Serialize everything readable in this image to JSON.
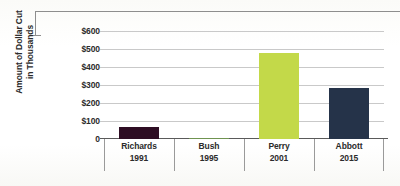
{
  "chart_data": {
    "type": "bar",
    "title": "",
    "xlabel": "",
    "ylabel": "Amount of Dollar Cut in Thousands",
    "ylabel_line1": "Amount of Dollar Cut",
    "ylabel_line2": "in Thousands",
    "categories": [
      "Richards 1991",
      "Bush 1995",
      "Perry 2001",
      "Abbott 2015"
    ],
    "category_names": [
      "Richards",
      "Bush",
      "Perry",
      "Abbott"
    ],
    "category_years": [
      "1991",
      "1995",
      "2001",
      "2015"
    ],
    "values": [
      64,
      8,
      480,
      285
    ],
    "value_labels": [
      "$64",
      "$8",
      "$480",
      "$285"
    ],
    "bar_colors": [
      "#2e0d23",
      "#6f9350",
      "#c3d949",
      "#253349"
    ],
    "ylim": [
      0,
      600
    ],
    "ytick_values": [
      0,
      100,
      200,
      300,
      400,
      500,
      600
    ],
    "ytick_labels": [
      "0",
      "$100",
      "$200",
      "$300",
      "$400",
      "$500",
      "$600"
    ],
    "grid": true,
    "legend": false,
    "legend_position": "none",
    "orientation": "vertical",
    "units": "thousands of dollars"
  },
  "decor": {
    "bracket_color": "#8e8e8e",
    "axis_color": "#5a5a5a",
    "grid_color": "#c9c9c9",
    "text_color": "#2b2b2b",
    "background": "#fdfdfb"
  }
}
